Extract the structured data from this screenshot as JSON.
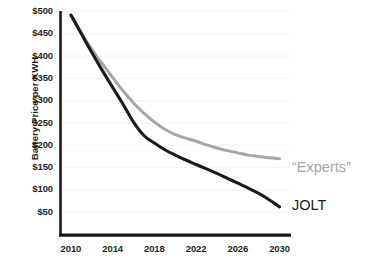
{
  "chart_data": {
    "type": "line",
    "title": "",
    "xlabel": "",
    "ylabel": "Battery Price per KWH",
    "xlim": [
      2009,
      2031
    ],
    "ylim": [
      0,
      500
    ],
    "grid": true,
    "legend_position": "right-inline",
    "x_ticks": [
      "2010",
      "2014",
      "2018",
      "2022",
      "2026",
      "2030"
    ],
    "x_tick_values": [
      2010,
      2014,
      2018,
      2022,
      2026,
      2030
    ],
    "y_ticks": [
      "$50",
      "$100",
      "$150",
      "$200",
      "$250",
      "$300",
      "$350",
      "$400",
      "$450",
      "$500"
    ],
    "y_tick_values": [
      50,
      100,
      150,
      200,
      250,
      300,
      350,
      400,
      450,
      500
    ],
    "x": [
      2010,
      2011,
      2012,
      2013,
      2014,
      2015,
      2016,
      2017,
      2018,
      2019,
      2020,
      2021,
      2022,
      2023,
      2024,
      2025,
      2026,
      2027,
      2028,
      2029,
      2030
    ],
    "series": [
      {
        "name": "“Experts”",
        "color": "#a6a6a6",
        "values": [
          492,
          452,
          415,
          383,
          352,
          322,
          295,
          272,
          252,
          236,
          224,
          216,
          209,
          201,
          194,
          188,
          183,
          178,
          175,
          172,
          170
        ]
      },
      {
        "name": "JOLT",
        "color": "#1a1a1a",
        "values": [
          492,
          450,
          408,
          368,
          330,
          292,
          252,
          222,
          205,
          190,
          178,
          167,
          157,
          147,
          137,
          126,
          115,
          104,
          92,
          78,
          62
        ]
      }
    ],
    "annotations": [
      {
        "text": "“Experts”",
        "series": "“Experts”",
        "color": "#a6a6a6"
      },
      {
        "text": "JOLT",
        "series": "JOLT",
        "color": "#1a1a1a"
      }
    ],
    "colors": {
      "axis": "#1a1a1a",
      "gridline": "#f0f0f0",
      "background": "#ffffff",
      "tick_text": "#231f20"
    }
  }
}
